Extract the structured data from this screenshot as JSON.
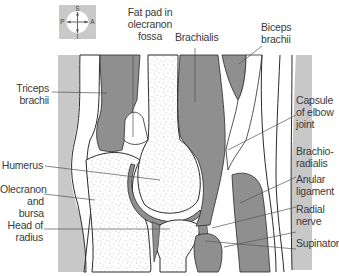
{
  "figure": {
    "colors": {
      "background": "#ffffff",
      "skin_band": "#c8c8c8",
      "muscle": "#8f8f8f",
      "bone_fill": "#ffffff",
      "outline": "#2a2a2a",
      "label_text": "#3a3a3a",
      "leader": "#555555"
    }
  },
  "compass": {
    "icon": "orientation-compass-icon",
    "top": "S",
    "bottom": "I",
    "left": "P",
    "right": "A"
  },
  "labels": {
    "fat_pad": [
      "Fat pad in",
      "olecranon",
      "fossa"
    ],
    "brachialis": [
      "Brachialis"
    ],
    "biceps": [
      "Biceps",
      "brachii"
    ],
    "triceps": [
      "Triceps",
      "brachii"
    ],
    "capsule": [
      "Capsule",
      "of elbow",
      "joint"
    ],
    "humerus": [
      "Humerus"
    ],
    "brachioradialis": [
      "Brachio-",
      "radialis"
    ],
    "olecranon": [
      "Olecranon",
      "and bursa"
    ],
    "anular": [
      "Anular",
      "ligament"
    ],
    "radial_nerve": [
      "Radial",
      "nerve"
    ],
    "head_radius": [
      "Head of",
      "radius"
    ],
    "supinator": [
      "Supinator"
    ]
  }
}
